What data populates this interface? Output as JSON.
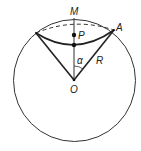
{
  "diagram": {
    "labels": {
      "M": "M",
      "P": "P",
      "A": "A",
      "R": "R",
      "alpha": "α",
      "O": "O"
    },
    "colors": {
      "stroke": "#2b2b2b",
      "background": "#ffffff"
    },
    "elements": [
      "outer circle",
      "dashed chord arc near top",
      "solid curved arc between endpoints",
      "radii from O to both endpoints",
      "vertical line O to M",
      "points P and arc midpoint",
      "angle alpha at O"
    ]
  }
}
